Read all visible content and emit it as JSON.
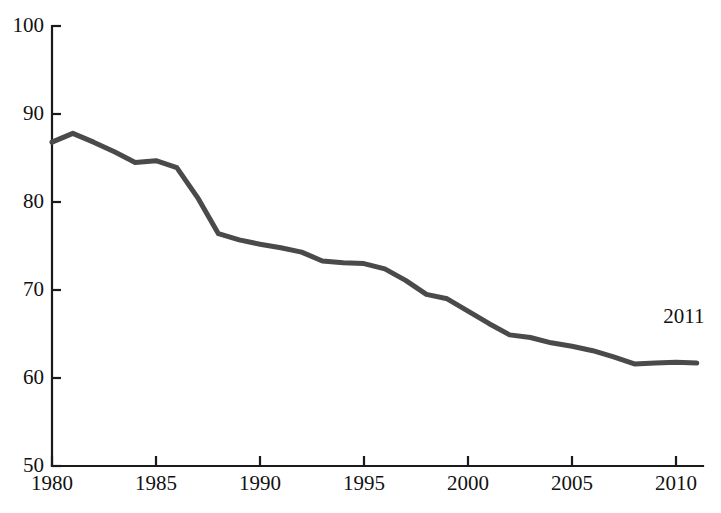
{
  "chart_data": {
    "type": "line",
    "title": "",
    "subtitle": "",
    "xlabel": "",
    "ylabel": "",
    "xlim": [
      1980,
      1981.2
    ],
    "ylim": [
      50,
      100
    ],
    "grid": false,
    "legend": null,
    "legend_position": "none",
    "line_color": "#4a4a4a",
    "axis_color": "#1a1a1a",
    "background_color": "#ffffff",
    "y_ticks": [
      50,
      60,
      70,
      80,
      90,
      100
    ],
    "y_tick_labels": [
      "50",
      "60",
      "70",
      "80",
      "90",
      "100"
    ],
    "x_ticks": [
      1980,
      1985,
      1990,
      1995,
      2000,
      2005,
      2010
    ],
    "x_tick_labels": [
      "1980",
      "1985",
      "1990",
      "1995",
      "2000",
      "2005",
      "2010"
    ],
    "x_range": [
      1980,
      2011
    ],
    "x": [
      1980,
      1981,
      1982,
      1983,
      1984,
      1985,
      1986,
      1987,
      1988,
      1989,
      1990,
      1991,
      1992,
      1993,
      1994,
      1995,
      1996,
      1997,
      1998,
      1999,
      2000,
      2001,
      2002,
      2003,
      2004,
      2005,
      2006,
      2007,
      2008,
      2009,
      2010,
      2011
    ],
    "values": [
      86.8,
      87.8,
      86.8,
      85.7,
      84.5,
      84.7,
      83.9,
      80.5,
      76.4,
      75.7,
      75.2,
      74.8,
      74.3,
      73.3,
      73.1,
      73.0,
      72.4,
      71.1,
      69.5,
      69.0,
      67.6,
      66.2,
      64.9,
      64.6,
      64.0,
      63.6,
      63.1,
      62.4,
      61.6,
      61.7,
      61.8,
      61.7
    ],
    "annotations": [
      {
        "text": "2011",
        "x_value": 2011,
        "y_value": 66.2,
        "name": "endpoint-year-label"
      }
    ]
  }
}
